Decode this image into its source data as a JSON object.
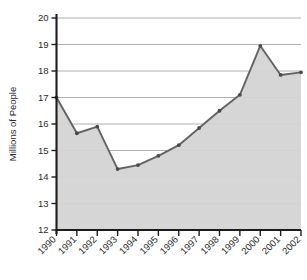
{
  "chart_data": {
    "type": "area",
    "title": "",
    "xlabel": "",
    "ylabel": "Millions of People",
    "ylim": [
      12,
      20
    ],
    "yticks": [
      12,
      13,
      14,
      15,
      16,
      17,
      18,
      19,
      20
    ],
    "grid": true,
    "legend": "none",
    "categories": [
      "1990",
      "1991",
      "1992",
      "1993",
      "1994",
      "1995",
      "1996",
      "1997",
      "1998",
      "1999",
      "2000",
      "2001",
      "2002"
    ],
    "values": [
      17.0,
      15.65,
      15.9,
      14.3,
      14.45,
      14.8,
      15.2,
      15.85,
      16.5,
      17.1,
      18.95,
      17.85,
      17.95
    ],
    "series": [
      {
        "name": "Millions of People",
        "values": [
          17.0,
          15.65,
          15.9,
          14.3,
          14.45,
          14.8,
          15.2,
          15.85,
          16.5,
          17.1,
          18.95,
          17.85,
          17.95
        ]
      }
    ],
    "colors": {
      "area_fill": "#d4d4d4",
      "line": "#636363",
      "marker": "#4a4a4a",
      "gridline": "#9a9a9a",
      "axis": "#1c1c1c",
      "text": "#2b2b2b",
      "background": "#ffffff"
    }
  }
}
